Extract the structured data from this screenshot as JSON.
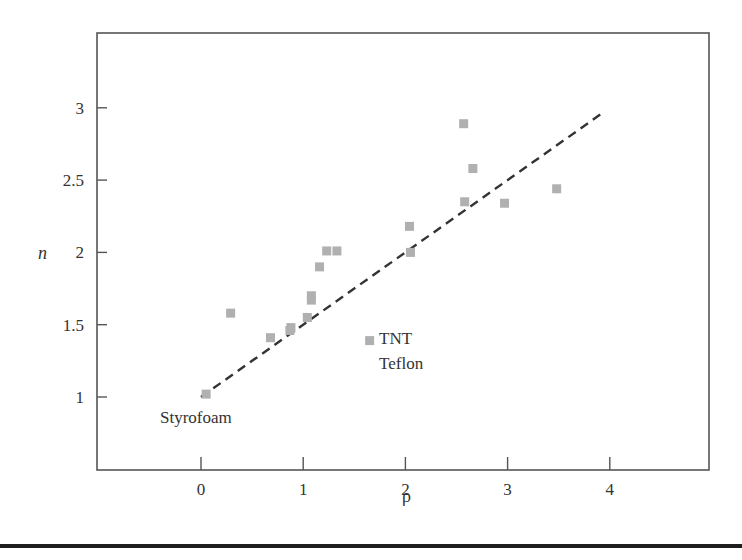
{
  "chart_data": {
    "type": "scatter",
    "title": "",
    "xlabel": "ρ",
    "ylabel": "n",
    "xlim": [
      -0.95,
      5.0
    ],
    "ylim": [
      0.5,
      3.5
    ],
    "xticks": [
      0,
      1,
      2,
      3,
      4
    ],
    "xtick_labels": [
      "0",
      "1",
      "2",
      "3",
      "4"
    ],
    "yticks": [
      1,
      1.5,
      2,
      2.5,
      3
    ],
    "ytick_labels": [
      "1",
      "1.5",
      "2",
      "2.5",
      "3"
    ],
    "grid": false,
    "legend": null,
    "marker": {
      "shape": "square",
      "color": "#b0b0b0"
    },
    "series": [
      {
        "name": "materials",
        "points": [
          {
            "x": 0.05,
            "y": 1.02
          },
          {
            "x": 0.29,
            "y": 1.58
          },
          {
            "x": 0.68,
            "y": 1.41
          },
          {
            "x": 0.87,
            "y": 1.46
          },
          {
            "x": 0.88,
            "y": 1.48
          },
          {
            "x": 1.04,
            "y": 1.55
          },
          {
            "x": 1.08,
            "y": 1.67
          },
          {
            "x": 1.08,
            "y": 1.7
          },
          {
            "x": 1.16,
            "y": 1.9
          },
          {
            "x": 1.23,
            "y": 2.01
          },
          {
            "x": 1.33,
            "y": 2.01
          },
          {
            "x": 1.65,
            "y": 1.39
          },
          {
            "x": 2.04,
            "y": 2.18
          },
          {
            "x": 2.05,
            "y": 2.0
          },
          {
            "x": 2.57,
            "y": 2.89
          },
          {
            "x": 2.66,
            "y": 2.58
          },
          {
            "x": 2.58,
            "y": 2.35
          },
          {
            "x": 2.97,
            "y": 2.34
          },
          {
            "x": 3.48,
            "y": 2.44
          }
        ]
      }
    ],
    "fit_line": {
      "style": "dashed",
      "color": "#333333",
      "x": [
        0,
        3.94
      ],
      "y": [
        1.0,
        2.97
      ],
      "equation": "n = 1 + 0.5ρ"
    },
    "annotations": [
      {
        "text": "Styrofoam",
        "x": 0.05,
        "y": 1.02
      },
      {
        "text": "TNT",
        "x": 1.65,
        "y": 1.39
      },
      {
        "text": "Teflon",
        "x": 1.65,
        "y": 1.39
      }
    ]
  },
  "axes": {
    "xlabel": "ρ",
    "ylabel": "n",
    "xticks": [
      "0",
      "1",
      "2",
      "3",
      "4"
    ],
    "yticks": [
      "1",
      "1.5",
      "2",
      "2.5",
      "3"
    ]
  },
  "annotations": {
    "styrofoam": "Styrofoam",
    "tnt": "TNT",
    "teflon": "Teflon"
  }
}
